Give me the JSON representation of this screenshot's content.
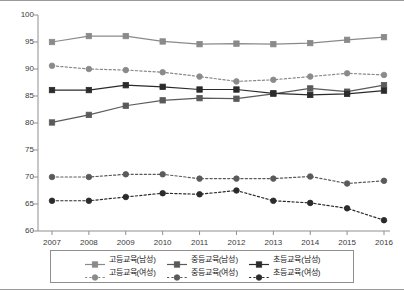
{
  "chart_data": {
    "type": "line",
    "title": "",
    "xlabel": "",
    "ylabel": "",
    "categories": [
      "2007",
      "2008",
      "2009",
      "2010",
      "2011",
      "2012",
      "2013",
      "2014",
      "2015",
      "2016"
    ],
    "ylim": [
      60,
      100
    ],
    "yticks": [
      "60",
      "65",
      "70",
      "75",
      "80",
      "85",
      "90",
      "95",
      "100"
    ],
    "grid": false,
    "legend_position": "bottom",
    "series": [
      {
        "name": "고등교육(남성)",
        "color": "#8a8a8a",
        "style": "solid",
        "marker": "square",
        "values": [
          95.0,
          96.1,
          96.1,
          95.1,
          94.6,
          94.7,
          94.6,
          94.8,
          95.4,
          95.9
        ]
      },
      {
        "name": "중등교육(남성)",
        "color": "#5a5a5a",
        "style": "solid",
        "marker": "square",
        "values": [
          80.1,
          81.5,
          83.2,
          84.2,
          84.6,
          84.5,
          85.4,
          86.4,
          85.8,
          87.0
        ]
      },
      {
        "name": "초등교육(남성)",
        "color": "#2b2b2b",
        "style": "solid",
        "marker": "square",
        "values": [
          86.1,
          86.1,
          87.0,
          86.7,
          86.2,
          86.2,
          85.5,
          85.2,
          85.4,
          86.0
        ]
      },
      {
        "name": "고등교육(여성)",
        "color": "#8a8a8a",
        "style": "dashed",
        "marker": "circle",
        "values": [
          90.6,
          90.0,
          89.8,
          89.4,
          88.6,
          87.7,
          88.0,
          88.6,
          89.2,
          88.9
        ]
      },
      {
        "name": "중등교육(여성)",
        "color": "#5a5a5a",
        "style": "dashed",
        "marker": "circle",
        "values": [
          70.0,
          70.0,
          70.5,
          70.5,
          69.7,
          69.7,
          69.7,
          70.1,
          68.8,
          69.3
        ]
      },
      {
        "name": "초등교육(여성)",
        "color": "#2b2b2b",
        "style": "dashed",
        "marker": "circle",
        "values": [
          65.6,
          65.6,
          66.3,
          67.0,
          66.8,
          67.5,
          65.6,
          65.2,
          64.2,
          62.0
        ]
      }
    ]
  },
  "legend": {
    "rows": [
      [
        {
          "label": "고등교육(남성)"
        },
        {
          "label": "중등교육(남성)"
        },
        {
          "label": "초등교육(남성)"
        }
      ],
      [
        {
          "label": "고등교육(여성)"
        },
        {
          "label": "중등교육(여성)"
        },
        {
          "label": "초등교육(여성)"
        }
      ]
    ]
  }
}
